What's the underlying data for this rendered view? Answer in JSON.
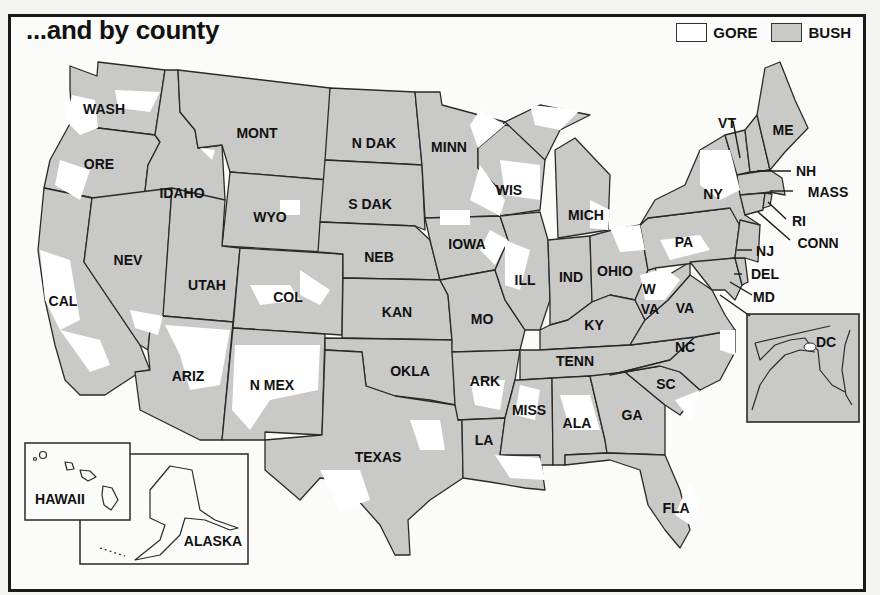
{
  "title": "...and by county",
  "legend": {
    "items": [
      {
        "label": "GORE",
        "color": "#ffffff"
      },
      {
        "label": "BUSH",
        "color": "#c9c9c7"
      }
    ]
  },
  "states": {
    "wash": "WASH",
    "ore": "ORE",
    "cal": "CAL",
    "idaho": "IDAHO",
    "nev": "NEV",
    "mont": "MONT",
    "wyo": "WYO",
    "utah": "UTAH",
    "ariz": "ARIZ",
    "col": "COL",
    "n_mex": "N MEX",
    "n_dak": "N DAK",
    "s_dak": "S DAK",
    "neb": "NEB",
    "kan": "KAN",
    "okla": "OKLA",
    "texas": "TEXAS",
    "minn": "MINN",
    "iowa": "IOWA",
    "mo": "MO",
    "ark": "ARK",
    "la": "LA",
    "wis": "WIS",
    "ill": "ILL",
    "mich": "MICH",
    "ind": "IND",
    "ohio": "OHIO",
    "ky": "KY",
    "tenn": "TENN",
    "miss": "MISS",
    "ala": "ALA",
    "ga": "GA",
    "fla": "FLA",
    "sc": "SC",
    "nc": "NC",
    "va": "VA",
    "w": "W",
    "w_va": "VA",
    "pa": "PA",
    "ny": "NY",
    "vt": "VT",
    "me": "ME",
    "nh": "NH",
    "mass": "MASS",
    "ri": "RI",
    "conn": "CONN",
    "nj": "NJ",
    "del": "DEL",
    "md": "MD",
    "dc": "DC",
    "hawaii": "HAWAII",
    "alaska": "ALASKA"
  }
}
